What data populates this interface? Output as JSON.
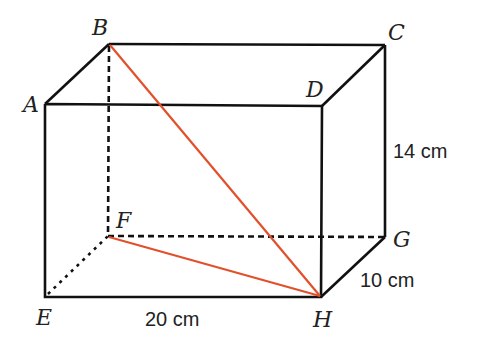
{
  "figure": {
    "type": "cuboid",
    "vertices": {
      "A": {
        "label": "A",
        "x": 45,
        "y": 104
      },
      "B": {
        "label": "B",
        "x": 109,
        "y": 44
      },
      "C": {
        "label": "C",
        "x": 385,
        "y": 45
      },
      "D": {
        "label": "D",
        "x": 322,
        "y": 106
      },
      "E": {
        "label": "E",
        "x": 45,
        "y": 297
      },
      "F": {
        "label": "F",
        "x": 108,
        "y": 236
      },
      "G": {
        "label": "G",
        "x": 385,
        "y": 237
      },
      "H": {
        "label": "H",
        "x": 321,
        "y": 297
      }
    },
    "dimensions": {
      "length": "20 cm",
      "width": "10 cm",
      "height": "14 cm"
    },
    "highlighted_segments": [
      "BH",
      "FH"
    ],
    "colors": {
      "edge": "#111111",
      "highlight": "#e2502b"
    }
  }
}
